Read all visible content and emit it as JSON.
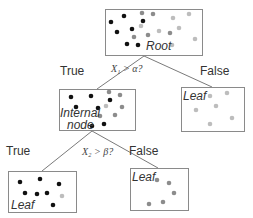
{
  "colors": {
    "black": "#111111",
    "dark_gray": "#8c8c8c",
    "light_gray": "#bdbdbd",
    "border": "#8a8a8a"
  },
  "nodes": {
    "root": {
      "label": "Root",
      "box": [
        105,
        9,
        97,
        46
      ]
    },
    "internal": {
      "label_line1": "Internal",
      "label_line2": "node",
      "box": [
        59,
        89,
        76,
        41
      ]
    },
    "leaf_right": {
      "label": "Leaf",
      "box": [
        181,
        87,
        63,
        44
      ]
    },
    "leaf_bottom_left": {
      "label": "Leaf",
      "box": [
        8,
        171,
        68,
        41
      ]
    },
    "leaf_bottom_right": {
      "label": "Leaf",
      "box": [
        130,
        168,
        58,
        42
      ]
    }
  },
  "splits": {
    "root": {
      "condition": "X₁ > α?",
      "true_label": "True",
      "false_label": "False"
    },
    "internal": {
      "condition": "X₂ > β?",
      "true_label": "True",
      "false_label": "False"
    }
  }
}
